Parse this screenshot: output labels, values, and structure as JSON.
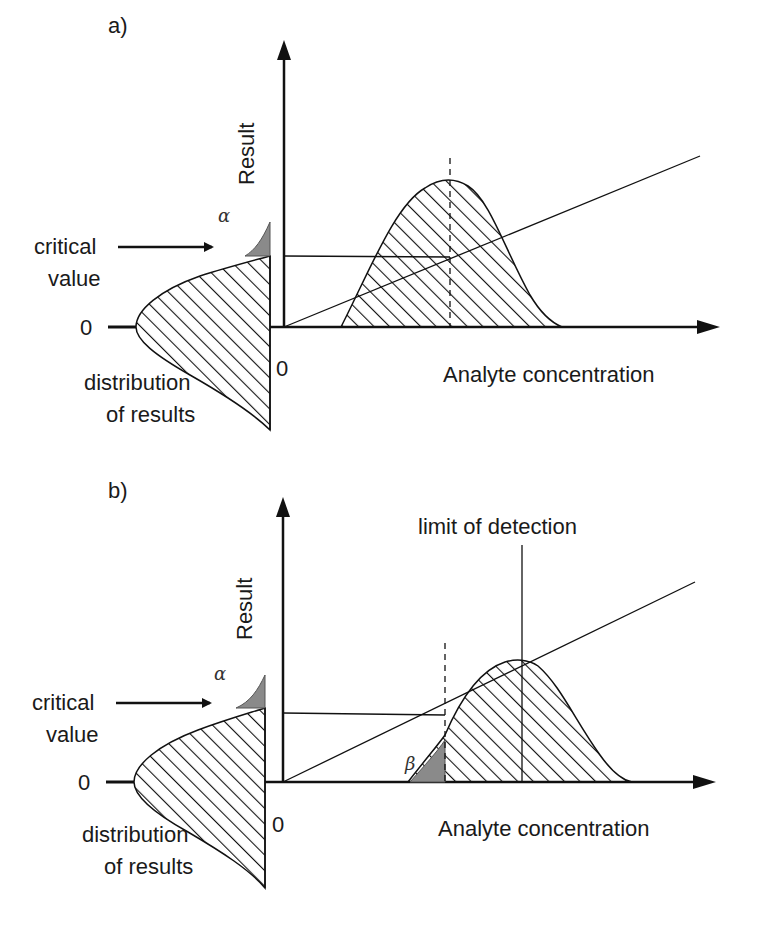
{
  "panels": [
    {
      "id": "a",
      "label": "a)",
      "y_axis_label": "Result",
      "x_axis_label": "Analyte concentration",
      "origin_label": "0",
      "left_zero_label": "0",
      "critical_value_label": [
        "critical",
        "value"
      ],
      "distribution_label": [
        "distribution",
        "of results"
      ],
      "alpha_symbol": "α"
    },
    {
      "id": "b",
      "label": "b)",
      "y_axis_label": "Result",
      "x_axis_label": "Analyte concentration",
      "origin_label": "0",
      "left_zero_label": "0",
      "critical_value_label": [
        "critical",
        "value"
      ],
      "distribution_label": [
        "distribution",
        "of results"
      ],
      "alpha_symbol": "α",
      "beta_symbol": "β",
      "lod_label": "limit of detection"
    }
  ],
  "colors": {
    "line": "#111111",
    "shaded_error": "#8a8a8a",
    "background": "#ffffff"
  }
}
